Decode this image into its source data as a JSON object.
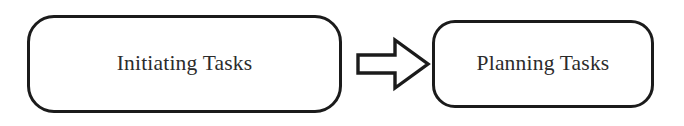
{
  "diagram": {
    "background_color": "#ffffff",
    "stroke_color": "#1b1b1b",
    "text_color": "#2b2b2b",
    "nodes": [
      {
        "id": "initiating",
        "label": "Initiating Tasks",
        "shape": "rounded-rectangle"
      },
      {
        "id": "planning",
        "label": "Planning Tasks",
        "shape": "rounded-rectangle"
      }
    ],
    "connectors": [
      {
        "id": "arrow-1",
        "type": "block-arrow",
        "direction": "right",
        "style": "outlined",
        "from": "initiating",
        "to": "planning",
        "label": ""
      }
    ]
  }
}
